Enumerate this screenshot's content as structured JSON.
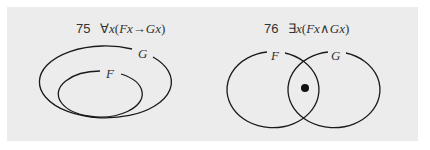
{
  "diagrams": [
    {
      "number": "75",
      "quantifier": "∀",
      "formula_var": "x",
      "formula_open": "(",
      "formula_left": "Fx",
      "connective": "→",
      "formula_right": "Gx",
      "formula_close": ")",
      "sets": [
        {
          "label": "G",
          "role": "outer"
        },
        {
          "label": "F",
          "role": "inner"
        }
      ],
      "relation": "F is a subset of G"
    },
    {
      "number": "76",
      "quantifier": "∃",
      "formula_var": "x",
      "formula_open": "(",
      "formula_left": "Fx",
      "connective": "∧",
      "formula_right": "Gx",
      "formula_close": ")",
      "sets": [
        {
          "label": "F",
          "role": "left"
        },
        {
          "label": "G",
          "role": "right"
        }
      ],
      "relation": "F and G overlap; marked element in intersection"
    }
  ],
  "colors": {
    "background": "#ececec",
    "stroke": "#1a1a1a",
    "text": "#333333"
  }
}
